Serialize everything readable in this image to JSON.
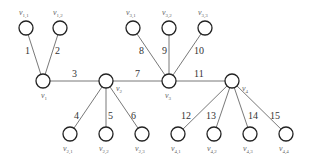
{
  "diagram": {
    "type": "tree-graph",
    "node_radius": 7,
    "nodes": [
      {
        "id": "v1",
        "base": "v",
        "sub": "1",
        "x": 43,
        "y": 81,
        "lx": 41,
        "ly": 98
      },
      {
        "id": "v2",
        "base": "v",
        "sub": "2",
        "x": 106,
        "y": 81,
        "lx": 116,
        "ly": 91
      },
      {
        "id": "v3",
        "base": "v",
        "sub": "3",
        "x": 169,
        "y": 81,
        "lx": 165,
        "ly": 98
      },
      {
        "id": "v4",
        "base": "v",
        "sub": "4",
        "x": 232,
        "y": 81,
        "lx": 242,
        "ly": 91
      },
      {
        "id": "v11",
        "base": "v",
        "sub": "1,1",
        "x": 26,
        "y": 28,
        "lx": 19,
        "ly": 15
      },
      {
        "id": "v12",
        "base": "v",
        "sub": "1,2",
        "x": 60,
        "y": 28,
        "lx": 53,
        "ly": 15
      },
      {
        "id": "v31",
        "base": "v",
        "sub": "3,1",
        "x": 133,
        "y": 28,
        "lx": 126,
        "ly": 15
      },
      {
        "id": "v32",
        "base": "v",
        "sub": "3,2",
        "x": 169,
        "y": 28,
        "lx": 162,
        "ly": 15
      },
      {
        "id": "v33",
        "base": "v",
        "sub": "3,3",
        "x": 205,
        "y": 28,
        "lx": 198,
        "ly": 15
      },
      {
        "id": "v21",
        "base": "v",
        "sub": "2,1",
        "x": 70,
        "y": 134,
        "lx": 63,
        "ly": 151
      },
      {
        "id": "v22",
        "base": "v",
        "sub": "2,2",
        "x": 106,
        "y": 134,
        "lx": 99,
        "ly": 151
      },
      {
        "id": "v23",
        "base": "v",
        "sub": "2,3",
        "x": 142,
        "y": 134,
        "lx": 135,
        "ly": 151
      },
      {
        "id": "v41",
        "base": "v",
        "sub": "4,1",
        "x": 178,
        "y": 134,
        "lx": 171,
        "ly": 151
      },
      {
        "id": "v42",
        "base": "v",
        "sub": "4,2",
        "x": 214,
        "y": 134,
        "lx": 207,
        "ly": 151
      },
      {
        "id": "v43",
        "base": "v",
        "sub": "4,3",
        "x": 250,
        "y": 134,
        "lx": 243,
        "ly": 151
      },
      {
        "id": "v44",
        "base": "v",
        "sub": "4,4",
        "x": 286,
        "y": 134,
        "lx": 279,
        "ly": 151
      }
    ],
    "edges": [
      {
        "label": "1",
        "from": "v1",
        "to": "v11",
        "lx": 25,
        "ly": 54
      },
      {
        "label": "2",
        "from": "v1",
        "to": "v12",
        "lx": 55,
        "ly": 54
      },
      {
        "label": "3",
        "from": "v1",
        "to": "v2",
        "lx": 72,
        "ly": 77
      },
      {
        "label": "7",
        "from": "v2",
        "to": "v3",
        "lx": 135,
        "ly": 77
      },
      {
        "label": "11",
        "from": "v3",
        "to": "v4",
        "lx": 194,
        "ly": 77
      },
      {
        "label": "8",
        "from": "v3",
        "to": "v31",
        "lx": 139,
        "ly": 54
      },
      {
        "label": "9",
        "from": "v3",
        "to": "v32",
        "lx": 162,
        "ly": 54
      },
      {
        "label": "10",
        "from": "v3",
        "to": "v33",
        "lx": 194,
        "ly": 54
      },
      {
        "label": "4",
        "from": "v2",
        "to": "v21",
        "lx": 74,
        "ly": 119
      },
      {
        "label": "5",
        "from": "v2",
        "to": "v22",
        "lx": 108,
        "ly": 119
      },
      {
        "label": "6",
        "from": "v2",
        "to": "v23",
        "lx": 131,
        "ly": 119
      },
      {
        "label": "12",
        "from": "v4",
        "to": "v41",
        "lx": 181,
        "ly": 119
      },
      {
        "label": "13",
        "from": "v4",
        "to": "v42",
        "lx": 206,
        "ly": 119
      },
      {
        "label": "14",
        "from": "v4",
        "to": "v43",
        "lx": 248,
        "ly": 119
      },
      {
        "label": "15",
        "from": "v4",
        "to": "v44",
        "lx": 270,
        "ly": 119
      }
    ]
  }
}
